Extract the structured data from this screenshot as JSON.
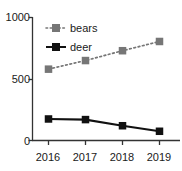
{
  "chart_data": {
    "type": "line",
    "title": "",
    "xlabel": "",
    "ylabel": "",
    "categories": [
      "2016",
      "2017",
      "2018",
      "2019"
    ],
    "series": [
      {
        "name": "bears",
        "values": [
          580,
          650,
          730,
          805
        ],
        "color": "#767676",
        "style": "dotted",
        "marker": "square"
      },
      {
        "name": "deer",
        "values": [
          175,
          170,
          120,
          75
        ],
        "color": "#111111",
        "style": "solid",
        "marker": "square"
      }
    ],
    "ylim": [
      0,
      1000
    ],
    "yticks": [
      "0",
      "500",
      "1000"
    ],
    "ytick_values": [
      0,
      500,
      1000
    ],
    "xticks": [
      "2016",
      "2017",
      "2018",
      "2019"
    ],
    "grid": false,
    "legend_position": "top-left",
    "legend": [
      "bears",
      "deer"
    ]
  },
  "axes": {
    "y": {
      "ticks": [
        {
          "label": "1000",
          "value": 1000
        },
        {
          "label": "500",
          "value": 500
        },
        {
          "label": "0",
          "value": 0
        }
      ]
    },
    "x": {
      "ticks": [
        {
          "label": "2016"
        },
        {
          "label": "2017"
        },
        {
          "label": "2018"
        },
        {
          "label": "2019"
        }
      ]
    }
  },
  "legend": {
    "entries": [
      {
        "label": "bears",
        "color": "#767676",
        "style": "dotted"
      },
      {
        "label": "deer",
        "color": "#111111",
        "style": "solid"
      }
    ]
  }
}
